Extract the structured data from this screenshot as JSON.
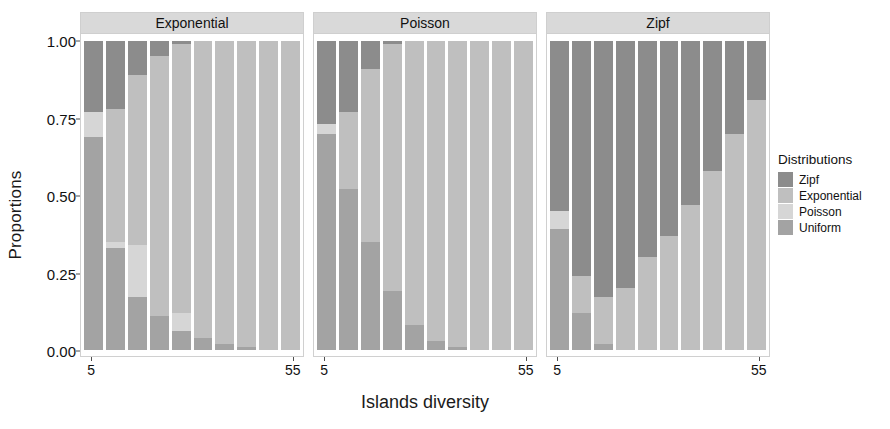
{
  "axes": {
    "ylabel": "Proportions",
    "xlabel": "Islands diversity",
    "yticks": [
      "0.00",
      "0.25",
      "0.50",
      "0.75",
      "1.00"
    ],
    "xticks": [
      "5",
      "55"
    ]
  },
  "legend": {
    "title": "Distributions",
    "items": [
      {
        "label": "Zipf",
        "color": "#8c8c8c"
      },
      {
        "label": "Exponential",
        "color": "#bfbfbf"
      },
      {
        "label": "Poisson",
        "color": "#d6d6d6"
      },
      {
        "label": "Uniform",
        "color": "#a3a3a3"
      }
    ]
  },
  "panels": [
    {
      "title": "Exponential"
    },
    {
      "title": "Poisson"
    },
    {
      "title": "Zipf"
    }
  ],
  "colors": {
    "zipf": "#8c8c8c",
    "exponential": "#bfbfbf",
    "poisson": "#d6d6d6",
    "uniform": "#a3a3a3",
    "strip": "#d9d9d9",
    "panel_border": "#d0d0d0",
    "text": "#111111"
  },
  "chart_data": {
    "type": "bar",
    "subtype": "stacked-proportional-faceted",
    "title": "",
    "xlabel": "Islands diversity",
    "ylabel": "Proportions",
    "ylim": [
      0,
      1
    ],
    "ytick_values": [
      0.0,
      0.25,
      0.5,
      0.75,
      1.0
    ],
    "grid": false,
    "legend_position": "right",
    "legend_title": "Distributions",
    "facet_variable": "Generating distribution",
    "facets": [
      "Exponential",
      "Poisson",
      "Zipf"
    ],
    "stack_order_top_to_bottom": [
      "Zipf",
      "Exponential",
      "Poisson",
      "Uniform"
    ],
    "series_names": [
      "Zipf",
      "Exponential",
      "Poisson",
      "Uniform"
    ],
    "x_categories": [
      "5",
      "10",
      "15",
      "20",
      "25",
      "30",
      "35",
      "40",
      "45",
      "55"
    ],
    "x_tick_labels_shown": [
      "5",
      "55"
    ],
    "panels": [
      {
        "facet": "Exponential",
        "bars": [
          {
            "x": "5",
            "Zipf": 0.23,
            "Exponential": 0.0,
            "Poisson": 0.08,
            "Uniform": 0.69
          },
          {
            "x": "10",
            "Zipf": 0.22,
            "Exponential": 0.43,
            "Poisson": 0.02,
            "Uniform": 0.33
          },
          {
            "x": "15",
            "Zipf": 0.11,
            "Exponential": 0.55,
            "Poisson": 0.17,
            "Uniform": 0.17
          },
          {
            "x": "20",
            "Zipf": 0.05,
            "Exponential": 0.84,
            "Poisson": 0.0,
            "Uniform": 0.11
          },
          {
            "x": "25",
            "Zipf": 0.01,
            "Exponential": 0.87,
            "Poisson": 0.06,
            "Uniform": 0.06
          },
          {
            "x": "30",
            "Zipf": 0.0,
            "Exponential": 0.96,
            "Poisson": 0.0,
            "Uniform": 0.04
          },
          {
            "x": "35",
            "Zipf": 0.0,
            "Exponential": 0.98,
            "Poisson": 0.0,
            "Uniform": 0.02
          },
          {
            "x": "40",
            "Zipf": 0.0,
            "Exponential": 0.99,
            "Poisson": 0.0,
            "Uniform": 0.01
          },
          {
            "x": "45",
            "Zipf": 0.0,
            "Exponential": 1.0,
            "Poisson": 0.0,
            "Uniform": 0.0
          },
          {
            "x": "55",
            "Zipf": 0.0,
            "Exponential": 1.0,
            "Poisson": 0.0,
            "Uniform": 0.0
          }
        ]
      },
      {
        "facet": "Poisson",
        "bars": [
          {
            "x": "5",
            "Zipf": 0.27,
            "Exponential": 0.0,
            "Poisson": 0.03,
            "Uniform": 0.7
          },
          {
            "x": "10",
            "Zipf": 0.23,
            "Exponential": 0.25,
            "Poisson": 0.0,
            "Uniform": 0.52
          },
          {
            "x": "15",
            "Zipf": 0.09,
            "Exponential": 0.56,
            "Poisson": 0.0,
            "Uniform": 0.35
          },
          {
            "x": "20",
            "Zipf": 0.01,
            "Exponential": 0.8,
            "Poisson": 0.0,
            "Uniform": 0.19
          },
          {
            "x": "25",
            "Zipf": 0.0,
            "Exponential": 0.92,
            "Poisson": 0.0,
            "Uniform": 0.08
          },
          {
            "x": "30",
            "Zipf": 0.0,
            "Exponential": 0.97,
            "Poisson": 0.0,
            "Uniform": 0.03
          },
          {
            "x": "35",
            "Zipf": 0.0,
            "Exponential": 0.99,
            "Poisson": 0.0,
            "Uniform": 0.01
          },
          {
            "x": "40",
            "Zipf": 0.0,
            "Exponential": 1.0,
            "Poisson": 0.0,
            "Uniform": 0.0
          },
          {
            "x": "45",
            "Zipf": 0.0,
            "Exponential": 1.0,
            "Poisson": 0.0,
            "Uniform": 0.0
          },
          {
            "x": "55",
            "Zipf": 0.0,
            "Exponential": 1.0,
            "Poisson": 0.0,
            "Uniform": 0.0
          }
        ]
      },
      {
        "facet": "Zipf",
        "bars": [
          {
            "x": "5",
            "Zipf": 0.55,
            "Exponential": 0.0,
            "Poisson": 0.06,
            "Uniform": 0.39
          },
          {
            "x": "10",
            "Zipf": 0.76,
            "Exponential": 0.12,
            "Poisson": 0.0,
            "Uniform": 0.12
          },
          {
            "x": "15",
            "Zipf": 0.83,
            "Exponential": 0.15,
            "Poisson": 0.0,
            "Uniform": 0.02
          },
          {
            "x": "20",
            "Zipf": 0.8,
            "Exponential": 0.2,
            "Poisson": 0.0,
            "Uniform": 0.0
          },
          {
            "x": "25",
            "Zipf": 0.7,
            "Exponential": 0.3,
            "Poisson": 0.0,
            "Uniform": 0.0
          },
          {
            "x": "30",
            "Zipf": 0.63,
            "Exponential": 0.37,
            "Poisson": 0.0,
            "Uniform": 0.0
          },
          {
            "x": "35",
            "Zipf": 0.53,
            "Exponential": 0.47,
            "Poisson": 0.0,
            "Uniform": 0.0
          },
          {
            "x": "40",
            "Zipf": 0.42,
            "Exponential": 0.58,
            "Poisson": 0.0,
            "Uniform": 0.0
          },
          {
            "x": "45",
            "Zipf": 0.3,
            "Exponential": 0.7,
            "Poisson": 0.0,
            "Uniform": 0.0
          },
          {
            "x": "55",
            "Zipf": 0.19,
            "Exponential": 0.81,
            "Poisson": 0.0,
            "Uniform": 0.0
          }
        ]
      }
    ]
  }
}
